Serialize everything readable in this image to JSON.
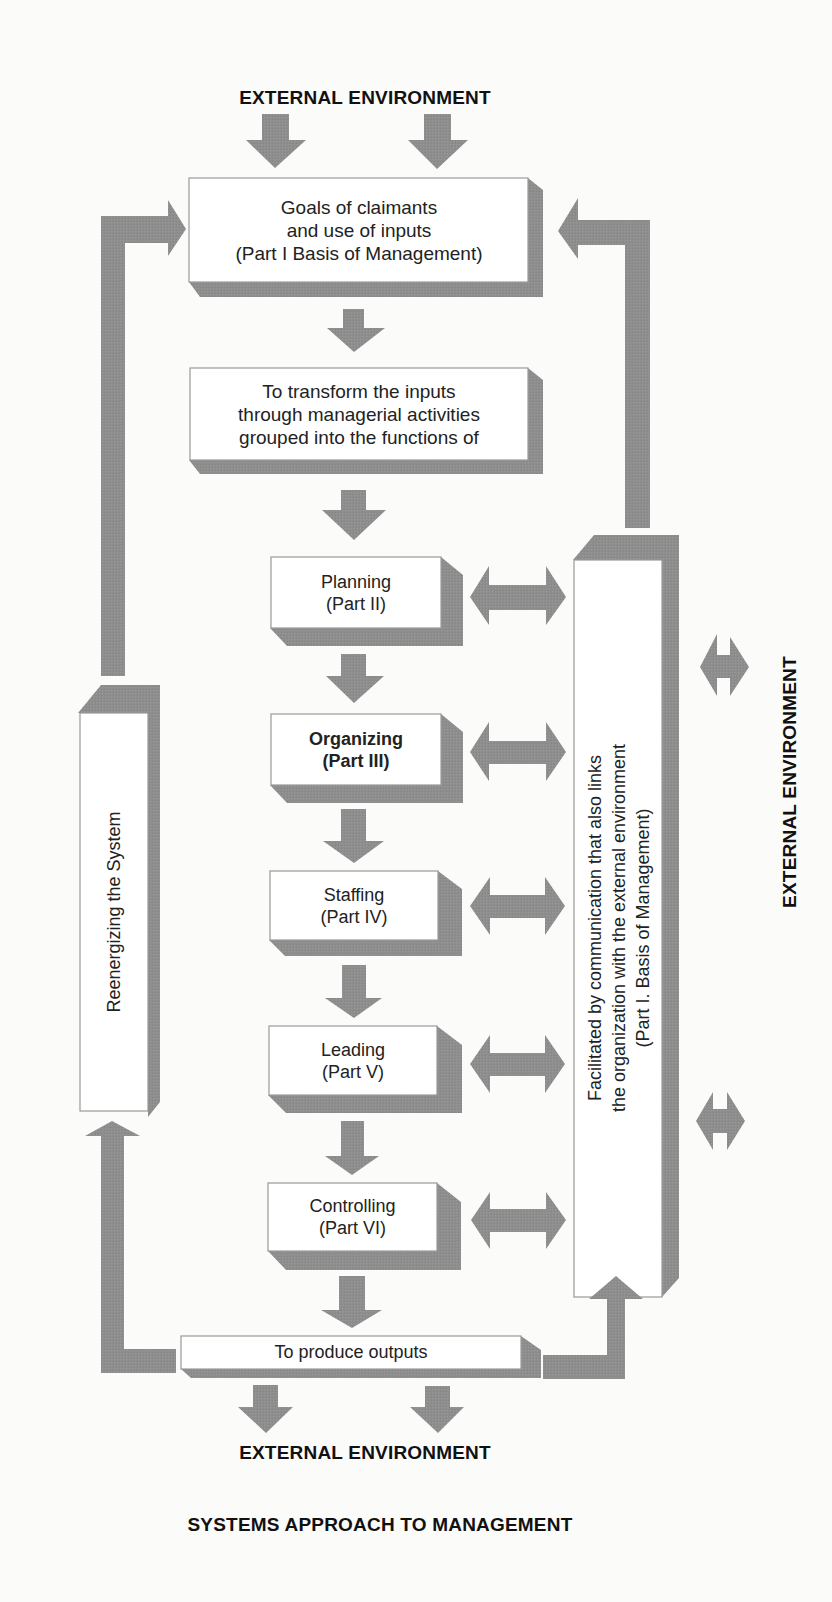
{
  "diagram": {
    "title": "SYSTEMS APPROACH TO MANAGEMENT",
    "colors": {
      "background": "#fbfbfa",
      "arrow_gray": "#8e8e8e",
      "shadow_gray": "#8c8c8c",
      "box_fill": "#ffffff",
      "box_border": "#9a9a9a",
      "text": "#1a1a1a"
    },
    "labels": {
      "external_top": "EXTERNAL ENVIRONMENT",
      "external_bottom": "EXTERNAL ENVIRONMENT",
      "external_right": "EXTERNAL ENVIRONMENT"
    },
    "boxes": {
      "goals": {
        "lines": [
          "Goals of claimants",
          "and use of inputs",
          "(Part I Basis of Management)"
        ]
      },
      "transform": {
        "lines": [
          "To transform the inputs",
          "through managerial activities",
          "grouped into the functions of"
        ]
      },
      "planning": {
        "lines": [
          "Planning",
          "(Part II)"
        ]
      },
      "organizing": {
        "lines": [
          "Organizing",
          "(Part III)"
        ],
        "bold": true
      },
      "staffing": {
        "lines": [
          "Staffing",
          "(Part IV)"
        ]
      },
      "leading": {
        "lines": [
          "Leading",
          "(Part V)"
        ]
      },
      "controlling": {
        "lines": [
          "Controlling",
          "(Part VI)"
        ]
      },
      "outputs": {
        "lines": [
          "To produce outputs"
        ]
      },
      "reenergizing": {
        "lines": [
          "Reenergizing the System"
        ]
      },
      "communication": {
        "lines": [
          "Facilitated by communication that also links",
          "the organization with the external environment",
          "(Part I. Basis of Management)"
        ]
      }
    },
    "arrows": [
      {
        "name": "input-arrow-left",
        "type": "down"
      },
      {
        "name": "input-arrow-right",
        "type": "down"
      },
      {
        "name": "goals-to-transform",
        "type": "down"
      },
      {
        "name": "transform-to-planning",
        "type": "down"
      },
      {
        "name": "planning-to-organizing",
        "type": "down"
      },
      {
        "name": "organizing-to-staffing",
        "type": "down"
      },
      {
        "name": "staffing-to-leading",
        "type": "down"
      },
      {
        "name": "leading-to-controlling",
        "type": "down"
      },
      {
        "name": "controlling-to-outputs",
        "type": "down"
      },
      {
        "name": "output-arrow-left",
        "type": "down"
      },
      {
        "name": "output-arrow-right",
        "type": "down"
      },
      {
        "name": "planning-communication",
        "type": "double-horizontal"
      },
      {
        "name": "organizing-communication",
        "type": "double-horizontal"
      },
      {
        "name": "staffing-communication",
        "type": "double-horizontal"
      },
      {
        "name": "leading-communication",
        "type": "double-horizontal"
      },
      {
        "name": "controlling-communication",
        "type": "double-horizontal"
      },
      {
        "name": "communication-external-upper",
        "type": "double-horizontal"
      },
      {
        "name": "communication-external-lower",
        "type": "double-horizontal"
      },
      {
        "name": "outputs-to-reenergizing",
        "type": "elbow-up"
      },
      {
        "name": "reenergizing-to-goals",
        "type": "elbow-right"
      },
      {
        "name": "outputs-to-communication",
        "type": "elbow-up"
      },
      {
        "name": "communication-to-goals",
        "type": "elbow-left"
      }
    ]
  }
}
